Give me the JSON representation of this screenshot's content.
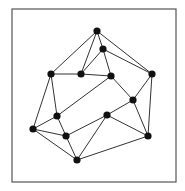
{
  "diagram": {
    "type": "graph",
    "frame": {
      "x": 12,
      "y": 9,
      "width": 164,
      "height": 173,
      "stroke": "#555555"
    },
    "node_color": "#111111",
    "edge_color": "#333333",
    "node_radius": 3.6,
    "nodes": [
      {
        "id": "A",
        "x": 97,
        "y": 31
      },
      {
        "id": "D",
        "x": 103,
        "y": 49
      },
      {
        "id": "B",
        "x": 51,
        "y": 74
      },
      {
        "id": "C",
        "x": 81,
        "y": 74
      },
      {
        "id": "F",
        "x": 111,
        "y": 76
      },
      {
        "id": "E",
        "x": 152,
        "y": 74
      },
      {
        "id": "I",
        "x": 133,
        "y": 100
      },
      {
        "id": "G",
        "x": 57,
        "y": 116
      },
      {
        "id": "M",
        "x": 107,
        "y": 115
      },
      {
        "id": "H",
        "x": 33,
        "y": 129
      },
      {
        "id": "K",
        "x": 66,
        "y": 136
      },
      {
        "id": "J",
        "x": 148,
        "y": 136
      },
      {
        "id": "L",
        "x": 77,
        "y": 160
      }
    ],
    "edges": [
      [
        "A",
        "B"
      ],
      [
        "A",
        "C"
      ],
      [
        "A",
        "D"
      ],
      [
        "A",
        "E"
      ],
      [
        "D",
        "C"
      ],
      [
        "D",
        "F"
      ],
      [
        "D",
        "E"
      ],
      [
        "B",
        "C"
      ],
      [
        "C",
        "F"
      ],
      [
        "B",
        "G"
      ],
      [
        "B",
        "H"
      ],
      [
        "F",
        "G"
      ],
      [
        "F",
        "I"
      ],
      [
        "E",
        "I"
      ],
      [
        "E",
        "J"
      ],
      [
        "G",
        "H"
      ],
      [
        "G",
        "K"
      ],
      [
        "H",
        "K"
      ],
      [
        "H",
        "L"
      ],
      [
        "K",
        "M"
      ],
      [
        "K",
        "L"
      ],
      [
        "M",
        "I"
      ],
      [
        "M",
        "J"
      ],
      [
        "M",
        "L"
      ],
      [
        "L",
        "J"
      ],
      [
        "I",
        "J"
      ]
    ]
  }
}
